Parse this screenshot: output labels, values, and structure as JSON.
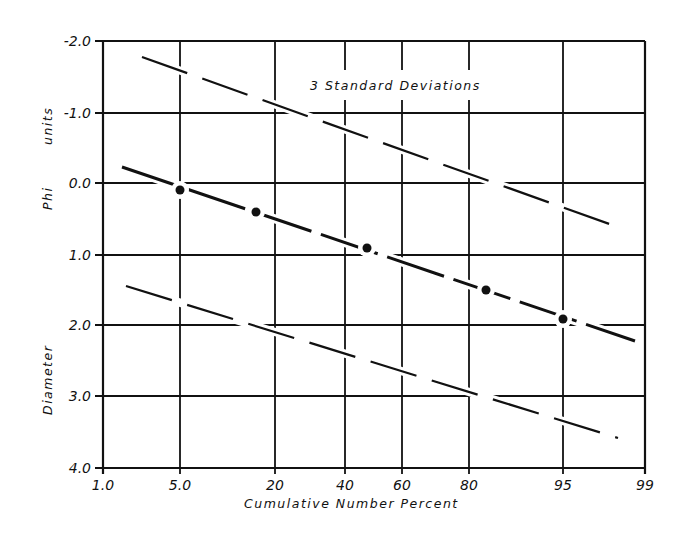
{
  "chart_data": {
    "type": "line",
    "title": "",
    "xlabel": "Cumulative Number Percent",
    "ylabel": "Diameter Phi units",
    "ylabel_parts": [
      "Diameter",
      "Phi",
      "units"
    ],
    "x_scale": "probability",
    "x_ticks": [
      "1.0",
      "5.0",
      "20",
      "40",
      "60",
      "80",
      "95",
      "99"
    ],
    "y_ticks": [
      "-2.0",
      "-1.0",
      "0.0",
      "1.0",
      "2.0",
      "3.0",
      "4.0"
    ],
    "ylim": [
      -2.0,
      4.0
    ],
    "y_inverted": true,
    "xlim": [
      1.0,
      99
    ],
    "grid": true,
    "annotation": "3 Standard Deviations",
    "series": [
      {
        "name": "Mean line (measured points)",
        "style": "solid-with-points",
        "x": [
          5.0,
          15,
          45,
          83,
          95
        ],
        "y": [
          0.1,
          0.4,
          0.9,
          1.5,
          1.9
        ]
      },
      {
        "name": "+3 standard deviations",
        "style": "dashed",
        "x": [
          2.5,
          97
        ],
        "y": [
          -1.8,
          0.6
        ]
      },
      {
        "name": "-3 standard deviations",
        "style": "dashed",
        "x": [
          2,
          97
        ],
        "y": [
          1.45,
          3.6
        ]
      },
      {
        "name": "Mean line extent",
        "style": "solid",
        "x": [
          2,
          98.5
        ],
        "y": [
          -0.25,
          2.2
        ]
      }
    ]
  },
  "plot": {
    "frame": {
      "left": 103,
      "right": 645,
      "top": 41,
      "bottom": 468
    },
    "x_grid_px": [
      103,
      180,
      275,
      345,
      402,
      469,
      563,
      645
    ],
    "y_grid_px": [
      41,
      113,
      183,
      255,
      325,
      396,
      468
    ],
    "points_px": [
      [
        180,
        190
      ],
      [
        256,
        212
      ],
      [
        367,
        248
      ],
      [
        486,
        290
      ],
      [
        563,
        319
      ]
    ],
    "mean_line_px": [
      [
        122,
        167
      ],
      [
        635,
        341
      ]
    ],
    "upper_line_px": [
      [
        142,
        57
      ],
      [
        615,
        226
      ]
    ],
    "lower_line_px": [
      [
        126,
        286
      ],
      [
        618,
        438
      ]
    ]
  }
}
